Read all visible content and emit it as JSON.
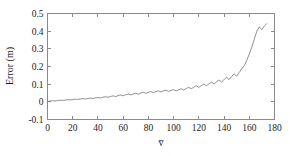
{
  "chart_data": {
    "type": "line",
    "title": "",
    "subtitle": "",
    "xlabel": "v̅",
    "ylabel": "Error (m)",
    "xlim": [
      0,
      180
    ],
    "ylim": [
      -0.1,
      0.5
    ],
    "xticks": [
      0,
      20,
      40,
      60,
      80,
      100,
      120,
      140,
      160,
      180
    ],
    "xtick_labels": [
      "0",
      "20",
      "40",
      "60",
      "80",
      "100",
      "120",
      "140",
      "160",
      "180"
    ],
    "yticks": [
      -0.1,
      0,
      0.1,
      0.2,
      0.3,
      0.4,
      0.5
    ],
    "ytick_labels": [
      "-0.1",
      "0",
      "0.1",
      "0.2",
      "0.3",
      "0.4",
      "0.5"
    ],
    "grid": false,
    "legend": null,
    "legend_position": "none",
    "series": [
      {
        "name": "Error",
        "color": "#6b6b6b",
        "x": [
          0,
          2,
          4,
          6,
          8,
          10,
          12,
          14,
          16,
          18,
          20,
          22,
          24,
          26,
          28,
          30,
          32,
          34,
          36,
          38,
          40,
          42,
          44,
          46,
          48,
          50,
          52,
          54,
          56,
          58,
          60,
          62,
          64,
          66,
          68,
          70,
          72,
          74,
          76,
          78,
          80,
          82,
          84,
          86,
          88,
          90,
          92,
          94,
          96,
          98,
          100,
          102,
          104,
          106,
          108,
          110,
          112,
          114,
          116,
          118,
          120,
          122,
          124,
          126,
          128,
          130,
          132,
          134,
          136,
          138,
          140,
          142,
          144,
          146,
          148,
          150,
          152,
          154,
          156,
          158,
          160,
          162,
          164,
          166,
          168,
          170,
          172,
          174
        ],
        "y": [
          0.002,
          0.004,
          0.006,
          0.005,
          0.007,
          0.009,
          0.008,
          0.01,
          0.012,
          0.011,
          0.013,
          0.015,
          0.014,
          0.016,
          0.018,
          0.016,
          0.019,
          0.021,
          0.019,
          0.022,
          0.024,
          0.022,
          0.026,
          0.029,
          0.026,
          0.03,
          0.034,
          0.03,
          0.035,
          0.039,
          0.034,
          0.04,
          0.044,
          0.039,
          0.045,
          0.049,
          0.043,
          0.05,
          0.054,
          0.048,
          0.054,
          0.058,
          0.052,
          0.058,
          0.062,
          0.056,
          0.062,
          0.066,
          0.059,
          0.065,
          0.069,
          0.062,
          0.069,
          0.074,
          0.067,
          0.075,
          0.082,
          0.074,
          0.083,
          0.091,
          0.082,
          0.092,
          0.101,
          0.091,
          0.102,
          0.112,
          0.101,
          0.113,
          0.124,
          0.112,
          0.126,
          0.139,
          0.126,
          0.143,
          0.159,
          0.145,
          0.166,
          0.187,
          0.205,
          0.235,
          0.27,
          0.31,
          0.355,
          0.4,
          0.425,
          0.408,
          0.43,
          0.443
        ]
      }
    ]
  }
}
